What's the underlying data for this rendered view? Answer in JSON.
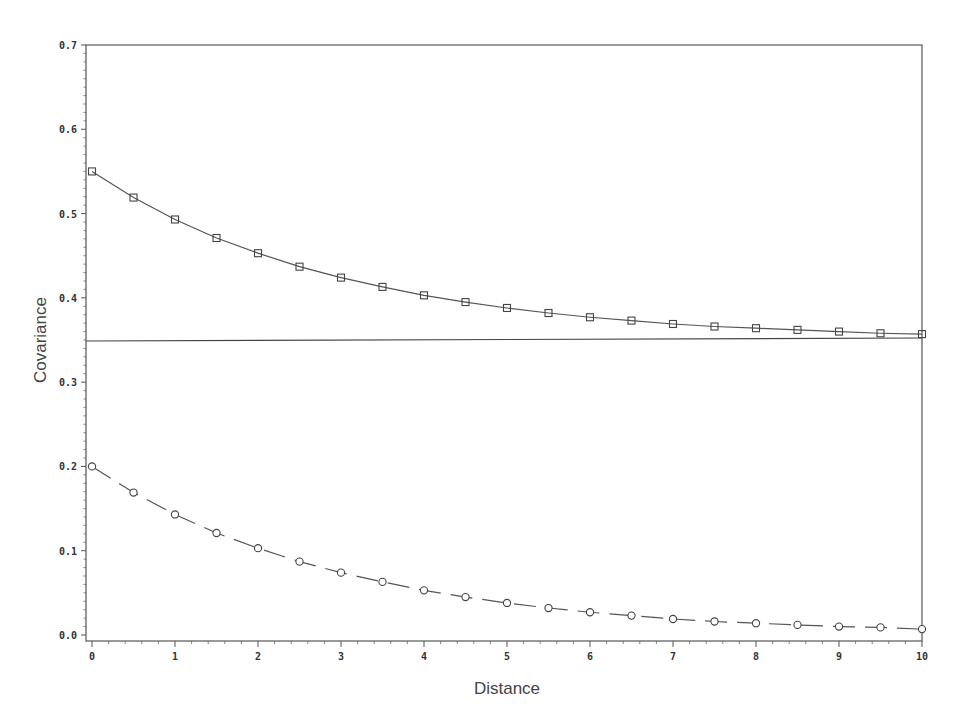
{
  "chart_data": {
    "type": "line",
    "title": "",
    "xlabel": "Distance",
    "ylabel": "Covariance",
    "xlim": [
      0,
      10
    ],
    "ylim": [
      0,
      0.7
    ],
    "x_ticks": [
      "0",
      "1",
      "2",
      "3",
      "4",
      "5",
      "6",
      "7",
      "8",
      "9",
      "10"
    ],
    "y_ticks": [
      "0.0",
      "0.1",
      "0.2",
      "0.3",
      "0.4",
      "0.5",
      "0.6",
      "0.7"
    ],
    "grid": false,
    "legend": null,
    "x": [
      0,
      0.5,
      1,
      1.5,
      2,
      2.5,
      3,
      3.5,
      4,
      4.5,
      5,
      5.5,
      6,
      6.5,
      7,
      7.5,
      8,
      8.5,
      9,
      9.5,
      10
    ],
    "series": [
      {
        "name": "upper (squares, solid)",
        "marker": "square",
        "line": "solid",
        "values": [
          0.55,
          0.519,
          0.493,
          0.471,
          0.453,
          0.437,
          0.424,
          0.413,
          0.403,
          0.395,
          0.388,
          0.382,
          0.377,
          0.373,
          0.369,
          0.366,
          0.364,
          0.362,
          0.36,
          0.358,
          0.357
        ]
      },
      {
        "name": "lower (circles, dashed)",
        "marker": "circle",
        "line": "dashed",
        "values": [
          0.2,
          0.169,
          0.143,
          0.121,
          0.103,
          0.087,
          0.074,
          0.063,
          0.053,
          0.045,
          0.038,
          0.032,
          0.027,
          0.023,
          0.019,
          0.016,
          0.014,
          0.012,
          0.01,
          0.009,
          0.007
        ]
      },
      {
        "name": "reference level",
        "marker": "none",
        "line": "solid",
        "values_constant": 0.35
      }
    ]
  }
}
